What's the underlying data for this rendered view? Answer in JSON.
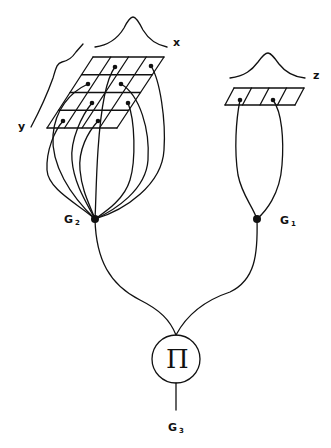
{
  "diagram": {
    "labels": {
      "x": "x",
      "y": "y",
      "z": "z",
      "g1_main": "G",
      "g1_sub": "1",
      "g2_main": "G",
      "g2_sub": "2",
      "g3_main": "G",
      "g3_sub": "3",
      "product_symbol": "Π"
    },
    "nodes": [
      {
        "id": "G2",
        "x": 95,
        "y": 219
      },
      {
        "id": "G1",
        "x": 257,
        "y": 219
      },
      {
        "id": "product",
        "x": 176,
        "y": 359,
        "r": 24
      }
    ],
    "grids": [
      {
        "id": "xy-grid",
        "rows": 4,
        "cols": 4
      },
      {
        "id": "z-strip",
        "rows": 1,
        "cols": 4
      }
    ],
    "stroke_color": "#111111"
  }
}
